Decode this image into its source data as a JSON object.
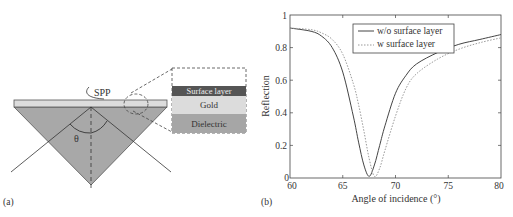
{
  "panel_a": {
    "label": "(a)",
    "spp_label": "SPP",
    "angle_label": "θ",
    "inset_layers": [
      "Surface layer",
      "Gold",
      "Dielectric"
    ],
    "colors": {
      "prism": "#a8a8a8",
      "gold": "#dcdcdc",
      "surface": "#555555",
      "dielectric": "#a6a6a6"
    }
  },
  "panel_b": {
    "label": "(b)",
    "xlabel": "Angle of incidence (°)",
    "ylabel": "Reflection",
    "xticks": [
      "60",
      "65",
      "70",
      "75",
      "80"
    ],
    "yticks": [
      "0",
      "0.2",
      "0.4",
      "0.6",
      "0.8",
      "1"
    ],
    "legend": [
      "w/o surface layer",
      "w surface layer"
    ]
  },
  "chart_data": {
    "type": "line",
    "title": "",
    "xlabel": "Angle of incidence (°)",
    "ylabel": "Reflection",
    "xlim": [
      60,
      80
    ],
    "ylim": [
      0,
      1
    ],
    "legend_position": "upper right",
    "grid": false,
    "x": [
      60,
      62,
      63,
      64,
      65,
      66,
      66.5,
      67,
      67.5,
      68,
      68.5,
      69,
      70,
      71,
      72,
      74,
      76,
      78,
      80
    ],
    "series": [
      {
        "name": "w/o surface layer",
        "style": "solid",
        "values": [
          0.92,
          0.9,
          0.87,
          0.8,
          0.65,
          0.38,
          0.22,
          0.08,
          0.01,
          0.08,
          0.2,
          0.32,
          0.52,
          0.63,
          0.7,
          0.77,
          0.82,
          0.85,
          0.88
        ]
      },
      {
        "name": "w surface layer",
        "style": "dotted",
        "values": [
          0.92,
          0.91,
          0.89,
          0.85,
          0.76,
          0.58,
          0.45,
          0.29,
          0.12,
          0.01,
          0.06,
          0.17,
          0.38,
          0.55,
          0.64,
          0.73,
          0.79,
          0.83,
          0.86
        ]
      }
    ]
  }
}
